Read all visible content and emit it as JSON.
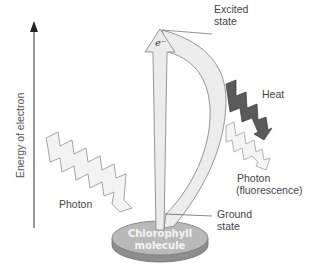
{
  "diagram": {
    "axis": {
      "label": "Energy of electron"
    },
    "labels": {
      "excited_state_line1": "Excited",
      "excited_state_line2": "state",
      "heat": "Heat",
      "photon_in": "Photon",
      "photon_out_line1": "Photon",
      "photon_out_line2": "(fluorescence)",
      "ground_state_line1": "Ground",
      "ground_state_line2": "state",
      "electron": "e⁻",
      "molecule_line1": "Chlorophyll",
      "molecule_line2": "molecule"
    },
    "colors": {
      "disc_top": "#b9b9b9",
      "disc_side": "#8e8e8e",
      "arrow_fill": "#ececec",
      "arrow_stroke": "#8a8a8a",
      "heat_fill": "#5a5a5a",
      "photon_fill": "#f2f2f2",
      "axis": "#333333"
    }
  }
}
